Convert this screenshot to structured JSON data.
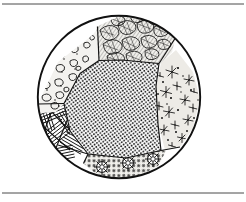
{
  "figure": {
    "title": "Textured circular diagram",
    "caption": "",
    "background_color": "#ffffff",
    "ink_color": "#121212",
    "frame": {
      "name": "page-rules",
      "line_color": "#4a4a4a",
      "top_rule_y": 4,
      "bottom_rule_y": 193,
      "line_width": 1
    },
    "circle": {
      "name": "specimen-circle",
      "center_x": 119,
      "center_y": 97,
      "radius": 82,
      "stroke_width": 1.8,
      "stroke_color": "#111111",
      "fill": "#ffffff"
    },
    "regions": [
      {
        "id": "region-blob",
        "label": "Upper-left blob texture",
        "pattern": "irregular-blobs",
        "position": "upper-left",
        "tone": "light",
        "fill": "#f2f1ee",
        "element_count": 64
      },
      {
        "id": "region-leaf",
        "label": "Top leaf-scale texture",
        "pattern": "overlapping-leaves",
        "position": "top-center",
        "tone": "dark",
        "fill": "#efeeea",
        "element_count": 34
      },
      {
        "id": "region-star",
        "label": "Right star-splat texture",
        "pattern": "sparse-stars",
        "position": "right",
        "tone": "light",
        "fill": "#eceae5",
        "element_count": 30
      },
      {
        "id": "region-stipple",
        "label": "Central dense stipple",
        "pattern": "dense-dots",
        "position": "center",
        "tone": "mid",
        "fill": "#ffffff",
        "element_count": 1400
      },
      {
        "id": "region-weave",
        "label": "Lower-left woven stripes",
        "pattern": "basket-weave-hatch",
        "position": "lower-left",
        "tone": "dark",
        "fill": "#ffffff",
        "element_count": 14
      },
      {
        "id": "region-floral",
        "label": "Bottom floral rosettes",
        "pattern": "rosette-repeat",
        "position": "bottom",
        "tone": "mid",
        "fill": "#f0efeb",
        "element_count": 3
      }
    ]
  }
}
